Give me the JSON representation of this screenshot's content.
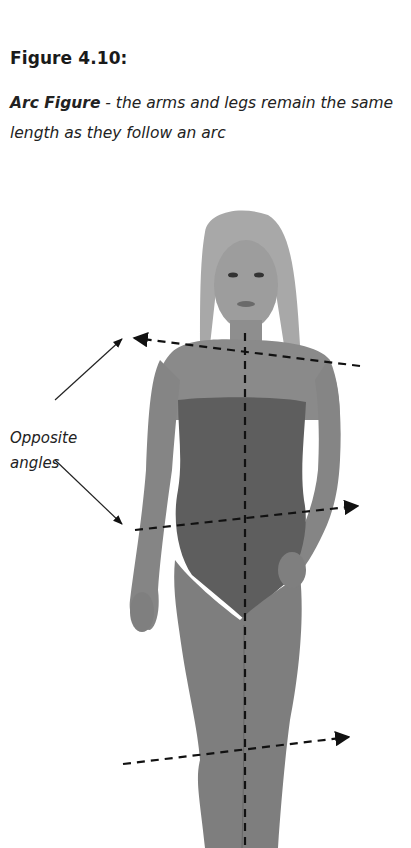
{
  "caption": {
    "figure_number": "Figure 4.10:",
    "title_bold": "Arc Figure",
    "description": " - the arms and legs remain the same length as they follow an arc"
  },
  "figure": {
    "annotation_label_line1": "Opposite",
    "annotation_label_line2": "angles",
    "guide_lines": [
      {
        "name": "shoulder-line",
        "direction": "left"
      },
      {
        "name": "hip-line",
        "direction": "right"
      },
      {
        "name": "knee-line",
        "direction": "right"
      },
      {
        "name": "center-line",
        "direction": "vertical"
      }
    ],
    "colors": {
      "background": "#ffffff",
      "line": "#111111",
      "skin": "#8a8a8a",
      "swimsuit": "#5e5e5e",
      "hair": "#a8a8a8"
    }
  }
}
